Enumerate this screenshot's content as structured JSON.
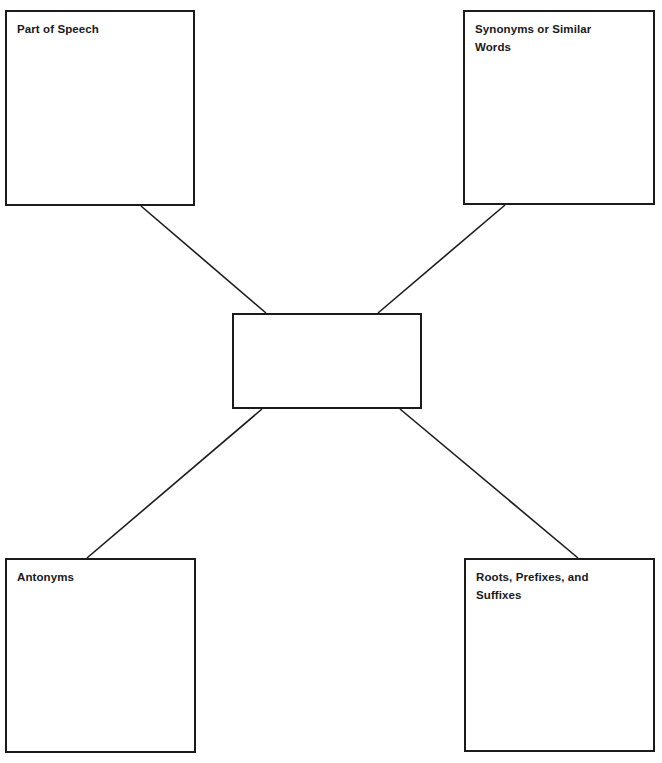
{
  "diagram": {
    "type": "concept-map",
    "background_color": "#ffffff",
    "line_color": "#1b1b1b",
    "text_color": "#19191b",
    "center": {
      "id": "center-word",
      "label": "",
      "placeholder": ""
    },
    "nodes": [
      {
        "id": "part-of-speech",
        "label": "Part of Speech",
        "position": "top-left",
        "content": ""
      },
      {
        "id": "synonyms",
        "label": "Synonyms or Similar\nWords",
        "position": "top-right",
        "content": ""
      },
      {
        "id": "antonyms",
        "label": "Antonyms",
        "position": "bottom-left",
        "content": ""
      },
      {
        "id": "roots-prefixes-suffixes",
        "label": "Roots, Prefixes, and\nSuffixes",
        "position": "bottom-right",
        "content": ""
      }
    ],
    "connectors": [
      {
        "id": "connector-part-of-speech",
        "from": "part-of-speech",
        "to": "center-word"
      },
      {
        "id": "connector-synonyms",
        "from": "synonyms",
        "to": "center-word"
      },
      {
        "id": "connector-antonyms",
        "from": "antonyms",
        "to": "center-word"
      },
      {
        "id": "connector-roots",
        "from": "roots-prefixes-suffixes",
        "to": "center-word"
      }
    ]
  }
}
